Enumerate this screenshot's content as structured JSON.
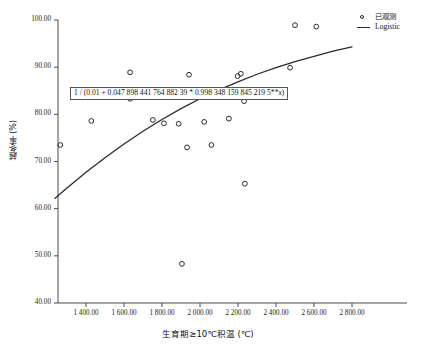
{
  "chart_data": {
    "type": "scatter",
    "title": "",
    "xlabel": "生育期≥10℃积温 (℃)",
    "ylabel": "越冬率 (%)",
    "xlim": [
      1237,
      2800
    ],
    "ylim": [
      40.0,
      100.0
    ],
    "grid": false,
    "legend_position": "top-right",
    "x_ticks": [
      1400,
      1600,
      1800,
      2000,
      2200,
      2400,
      2600,
      2800
    ],
    "x_tick_labels": [
      "1 400.00",
      "1 600.00",
      "1 800.00",
      "2 000.00",
      "2 200.00",
      "2 400.00",
      "2 600.00",
      "2 800.00"
    ],
    "y_ticks": [
      40,
      50,
      60,
      70,
      80,
      90,
      100
    ],
    "y_tick_labels": [
      "40.00",
      "50.00",
      "60.00",
      "70.00",
      "80.00",
      "90.00",
      "100.00"
    ],
    "series": [
      {
        "name": "已观测",
        "type": "scatter",
        "marker": "open-circle",
        "color": "#2b2b2b",
        "points": [
          {
            "x": 1265,
            "y": 73.5
          },
          {
            "x": 1428,
            "y": 78.6
          },
          {
            "x": 1632,
            "y": 88.9
          },
          {
            "x": 1632,
            "y": 83.3
          },
          {
            "x": 1752,
            "y": 78.8
          },
          {
            "x": 1810,
            "y": 78.1
          },
          {
            "x": 1888,
            "y": 78.0
          },
          {
            "x": 1905,
            "y": 48.3
          },
          {
            "x": 1932,
            "y": 73.0
          },
          {
            "x": 1942,
            "y": 88.4
          },
          {
            "x": 2022,
            "y": 78.4
          },
          {
            "x": 2060,
            "y": 73.5
          },
          {
            "x": 2152,
            "y": 79.1
          },
          {
            "x": 2198,
            "y": 88.1
          },
          {
            "x": 2215,
            "y": 88.6
          },
          {
            "x": 2232,
            "y": 82.8
          },
          {
            "x": 2236,
            "y": 65.3
          },
          {
            "x": 2474,
            "y": 89.9
          },
          {
            "x": 2500,
            "y": 98.9
          },
          {
            "x": 2612,
            "y": 98.6
          }
        ]
      },
      {
        "name": "Logistic",
        "type": "line",
        "color": "#2b2b2b",
        "equation_text": "1 / (0.01 + 0.047 898 441 764 882 39 * 0.998 348 159 845 219 5**x)",
        "params": {
          "asymptote_coef": 0.01,
          "a": 0.04789844176488239,
          "b": 0.9983481598452195
        },
        "points": [
          {
            "x": 1237,
            "y": 62.2
          },
          {
            "x": 1300,
            "y": 64.4
          },
          {
            "x": 1400,
            "y": 67.7
          },
          {
            "x": 1500,
            "y": 70.8
          },
          {
            "x": 1600,
            "y": 73.7
          },
          {
            "x": 1700,
            "y": 76.4
          },
          {
            "x": 1800,
            "y": 78.9
          },
          {
            "x": 1900,
            "y": 81.2
          },
          {
            "x": 2000,
            "y": 83.3
          },
          {
            "x": 2100,
            "y": 85.2
          },
          {
            "x": 2200,
            "y": 86.9
          },
          {
            "x": 2300,
            "y": 88.5
          },
          {
            "x": 2400,
            "y": 89.9
          },
          {
            "x": 2500,
            "y": 91.2
          },
          {
            "x": 2600,
            "y": 92.3
          },
          {
            "x": 2700,
            "y": 93.4
          },
          {
            "x": 2800,
            "y": 94.3
          }
        ]
      }
    ]
  },
  "axes": {
    "y_title": "越冬率 (%)",
    "x_title": "生育期≥10℃积温 (℃)",
    "y_tick_labels": [
      "100.00",
      "90.00",
      "80.00",
      "70.00",
      "60.00",
      "50.00",
      "40.00"
    ],
    "x_tick_labels": [
      "1 400.00",
      "1 600.00",
      "1 800.00",
      "2 000.00",
      "2 200.00",
      "2 400.00",
      "2 600.00",
      "2 800.00"
    ]
  },
  "annotation": {
    "equation": "1 / (0.01 + 0.047 898 441 764 882 39 * 0.998 348 159 845 219 5**x)",
    "equation_prefix": "1 / (0.01 + 0.047 898 441 764 882 39 * 0.998 348 159 845 219 5**",
    "equation_variable": "x",
    "equation_suffix": ")"
  },
  "legend": {
    "items": [
      {
        "label": "已观测",
        "marker": "open-circle-marker",
        "color": "#2b2b2b"
      },
      {
        "label": "Logistic",
        "marker": "line-marker",
        "color": "#2b2b2b"
      }
    ]
  },
  "colors": {
    "axis": "#4a4a4a",
    "marker": "#2b2b2b",
    "curve": "#2b2b2b",
    "text": "#111111",
    "background": "#ffffff"
  }
}
